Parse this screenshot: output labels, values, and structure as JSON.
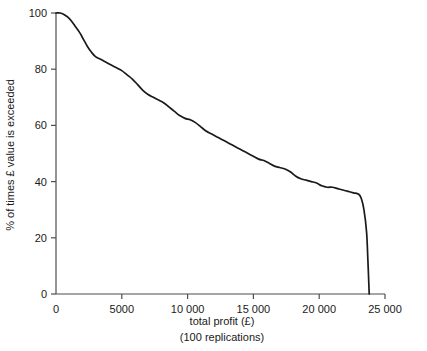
{
  "chart_data": {
    "type": "line",
    "title": "",
    "xlabel": "total profit (£)",
    "xlabel_sub": "(100 replications)",
    "ylabel": "% of times £ value is exceeded",
    "xlim": [
      0,
      25000
    ],
    "ylim": [
      0,
      100
    ],
    "grid": false,
    "legend": false,
    "x_ticks": [
      0,
      5000,
      10000,
      15000,
      20000,
      25000
    ],
    "x_tick_labels": [
      "0",
      "5000",
      "10 000",
      "15 000",
      "20 000",
      "25 000"
    ],
    "y_ticks": [
      0,
      20,
      40,
      60,
      80,
      100
    ],
    "y_tick_labels": [
      "0",
      "20",
      "40",
      "60",
      "80",
      "100"
    ],
    "line_color": "#1a1a1a",
    "axis_color": "#4d4d4d",
    "series": [
      {
        "name": "exceedance curve",
        "x": [
          0,
          300,
          600,
          900,
          1200,
          1500,
          1800,
          2100,
          2400,
          2700,
          3000,
          3400,
          3800,
          4200,
          4600,
          5000,
          5400,
          5800,
          6200,
          6600,
          7000,
          7400,
          7800,
          8200,
          8600,
          9000,
          9400,
          9800,
          10200,
          10600,
          11000,
          11400,
          11800,
          12200,
          12600,
          13000,
          13400,
          13800,
          14200,
          14600,
          15000,
          15400,
          15800,
          16200,
          16600,
          17000,
          17400,
          17800,
          18200,
          18600,
          19000,
          19400,
          19800,
          20200,
          20600,
          21000,
          21400,
          21800,
          22200,
          22600,
          23000,
          23200,
          23400,
          23600,
          23700,
          23800
        ],
        "y": [
          100,
          100,
          99.5,
          98.5,
          97,
          95,
          93,
          90.5,
          88,
          86,
          84.5,
          83.5,
          82.5,
          81.5,
          80.5,
          79.5,
          78,
          76.5,
          74.5,
          72.5,
          71,
          70,
          69,
          68,
          66.5,
          65,
          63.5,
          62.5,
          62,
          61,
          59.5,
          58,
          57,
          56,
          55,
          54,
          53,
          52,
          51,
          50,
          49,
          48,
          47.5,
          46.5,
          45.5,
          45,
          44.5,
          43.5,
          42,
          41,
          40.5,
          40,
          39.5,
          38.5,
          38,
          38,
          37.5,
          37,
          36.5,
          36,
          35.5,
          34,
          30,
          22,
          12,
          0
        ]
      }
    ]
  }
}
